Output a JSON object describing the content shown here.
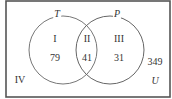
{
  "diagram": {
    "type": "venn",
    "universe_label": "U",
    "sets": [
      {
        "name": "T"
      },
      {
        "name": "P"
      }
    ],
    "regions": [
      {
        "roman": "I",
        "count": "79"
      },
      {
        "roman": "II",
        "count": "41"
      },
      {
        "roman": "III",
        "count": "31"
      },
      {
        "roman": "IV",
        "count": "349"
      }
    ],
    "colors": {
      "outline": "#555555",
      "circle": "#666666",
      "text": "#333333"
    }
  }
}
